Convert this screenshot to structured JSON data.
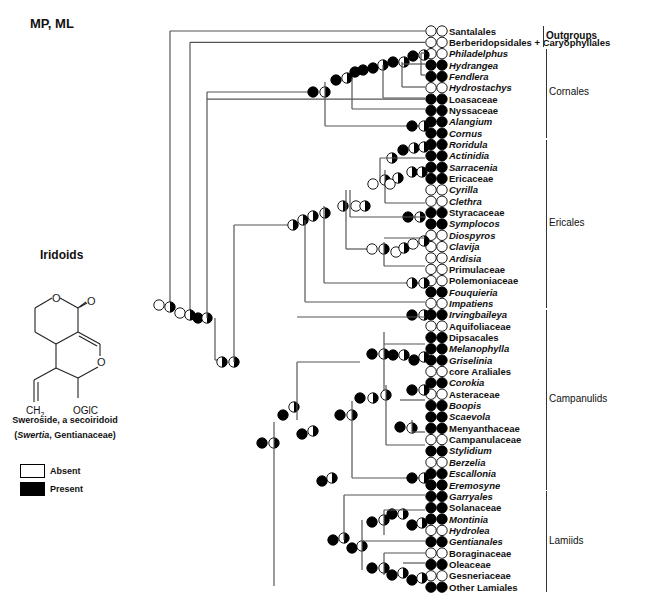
{
  "title": "MP, ML",
  "structure_panel": {
    "heading": "Iridoids",
    "atoms": {
      "o_ring": "O",
      "o_carbonyl": "O",
      "o_ring2": "O",
      "ch2": "CH",
      "ch2_sub": "2",
      "oglc": "OGlC"
    },
    "caption_line1": "Sweroside, a secoiridoid",
    "caption_genus": "Swertia",
    "caption_family": ", Gentianaceae)"
  },
  "legend": {
    "absent": "Absent",
    "present": "Present",
    "colors": {
      "absent": "#ffffff",
      "present": "#000000"
    }
  },
  "groups": [
    {
      "label": "Outgroups",
      "first": 0,
      "last": 1
    },
    {
      "label": "Cornales",
      "first": 2,
      "last": 9
    },
    {
      "label": "Ericales",
      "first": 10,
      "last": 24
    },
    {
      "label": "Campanulids",
      "first": 25,
      "last": 40
    },
    {
      "label": "Lamiids",
      "first": 41,
      "last": 49
    }
  ],
  "leaves": [
    {
      "label": "Santalales",
      "italic": false,
      "state": "absent"
    },
    {
      "label": "Berberidopsidales + Caryophyllales",
      "italic": false,
      "state": "absent"
    },
    {
      "label": "Philadelphus",
      "italic": true,
      "state": "absent"
    },
    {
      "label": "Hydrangea",
      "italic": true,
      "state": "present"
    },
    {
      "label": "Fendlera",
      "italic": true,
      "state": "present"
    },
    {
      "label": "Hydrostachys",
      "italic": true,
      "state": "absent"
    },
    {
      "label": "Loasaceae",
      "italic": false,
      "state": "present"
    },
    {
      "label": "Nyssaceae",
      "italic": false,
      "state": "present"
    },
    {
      "label": "Alangium",
      "italic": true,
      "state": "present"
    },
    {
      "label": "Cornus",
      "italic": true,
      "state": "present"
    },
    {
      "label": "Roridula",
      "italic": true,
      "state": "present"
    },
    {
      "label": "Actinidia",
      "italic": true,
      "state": "present"
    },
    {
      "label": "Sarracenia",
      "italic": true,
      "state": "present"
    },
    {
      "label": "Ericaceae",
      "italic": false,
      "state": "present"
    },
    {
      "label": "Cyrilla",
      "italic": true,
      "state": "absent"
    },
    {
      "label": "Clethra",
      "italic": true,
      "state": "absent"
    },
    {
      "label": "Styracaceae",
      "italic": false,
      "state": "present"
    },
    {
      "label": "Symplocos",
      "italic": true,
      "state": "present"
    },
    {
      "label": "Diospyros",
      "italic": true,
      "state": "absent"
    },
    {
      "label": "Clavija",
      "italic": true,
      "state": "absent"
    },
    {
      "label": "Ardisia",
      "italic": true,
      "state": "absent"
    },
    {
      "label": "Primulaceae",
      "italic": false,
      "state": "absent"
    },
    {
      "label": "Polemoniaceae",
      "italic": false,
      "state": "absent"
    },
    {
      "label": "Fouquieria",
      "italic": true,
      "state": "present"
    },
    {
      "label": "Impatiens",
      "italic": true,
      "state": "absent"
    },
    {
      "label": "Irvingbaileya",
      "italic": true,
      "state": "present"
    },
    {
      "label": "Aquifoliaceae",
      "italic": false,
      "state": "absent"
    },
    {
      "label": "Dipsacales",
      "italic": false,
      "state": "present"
    },
    {
      "label": "Melanophylla",
      "italic": true,
      "state": "present"
    },
    {
      "label": "Griselinia",
      "italic": true,
      "state": "present"
    },
    {
      "label": "core Araliales",
      "italic": false,
      "state": "absent"
    },
    {
      "label": "Corokia",
      "italic": true,
      "state": "present"
    },
    {
      "label": "Asteraceae",
      "italic": false,
      "state": "absent"
    },
    {
      "label": "Boopis",
      "italic": true,
      "state": "present"
    },
    {
      "label": "Scaevola",
      "italic": true,
      "state": "present"
    },
    {
      "label": "Menyanthaceae",
      "italic": false,
      "state": "present"
    },
    {
      "label": "Campanulaceae",
      "italic": false,
      "state": "absent"
    },
    {
      "label": "Stylidium",
      "italic": true,
      "state": "present"
    },
    {
      "label": "Berzelia",
      "italic": true,
      "state": "absent"
    },
    {
      "label": "Escallonia",
      "italic": true,
      "state": "present"
    },
    {
      "label": "Eremosyne",
      "italic": true,
      "state": "present"
    },
    {
      "label": "Garryales",
      "italic": true,
      "state": "present"
    },
    {
      "label": "Solanaceae",
      "italic": false,
      "state": "present"
    },
    {
      "label": "Montinia",
      "italic": true,
      "state": "present"
    },
    {
      "label": "Hydrolea",
      "italic": true,
      "state": "absent"
    },
    {
      "label": "Gentianales",
      "italic": true,
      "state": "present"
    },
    {
      "label": "Boraginaceae",
      "italic": false,
      "state": "absent"
    },
    {
      "label": "Oleaceae",
      "italic": false,
      "state": "present"
    },
    {
      "label": "Gesneriaceae",
      "italic": false,
      "state": "absent"
    },
    {
      "label": "Other Lamiales",
      "italic": false,
      "state": "present"
    }
  ],
  "layout": {
    "first_row_y": 31,
    "row_step": 11.35,
    "leaf_dot1_x": 431,
    "leaf_dot2_x": 442,
    "label_x": 449
  }
}
